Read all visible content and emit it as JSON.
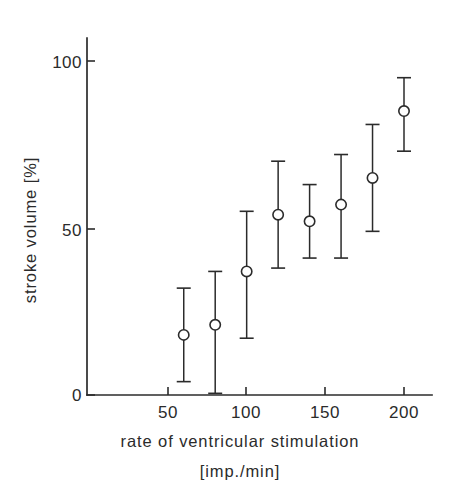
{
  "chart_data": {
    "type": "scatter",
    "title": "",
    "xlabel": "rate of ventricular stimulation",
    "xlabel_units": "[imp./min]",
    "ylabel": "stroke volume [%]",
    "xlim": [
      0,
      215
    ],
    "ylim": [
      0,
      108
    ],
    "grid": false,
    "legend": null,
    "error_bars": "vertical, capped",
    "marker_style": "open circle",
    "x_ticks": [
      50,
      100,
      150,
      200
    ],
    "x_tick_labels": [
      "50",
      "100",
      "150",
      "200"
    ],
    "y_ticks": [
      0,
      50,
      100
    ],
    "y_tick_labels": [
      "0",
      "50",
      "100"
    ],
    "x": [
      60,
      80,
      100,
      120,
      140,
      160,
      180,
      200
    ],
    "values": [
      18,
      21,
      37,
      54,
      52,
      57,
      65,
      85
    ],
    "err_low": [
      4,
      0.5,
      17,
      38,
      41,
      41,
      49,
      73
    ],
    "err_high": [
      32,
      37,
      55,
      70,
      63,
      72,
      81,
      95
    ],
    "points": [
      {
        "x": 60,
        "y": 18,
        "low": 4,
        "high": 32
      },
      {
        "x": 80,
        "y": 21,
        "low": 0.5,
        "high": 37
      },
      {
        "x": 100,
        "y": 37,
        "low": 17,
        "high": 55
      },
      {
        "x": 120,
        "y": 54,
        "low": 38,
        "high": 70
      },
      {
        "x": 140,
        "y": 52,
        "low": 41,
        "high": 63
      },
      {
        "x": 160,
        "y": 57,
        "low": 41,
        "high": 72
      },
      {
        "x": 180,
        "y": 65,
        "low": 49,
        "high": 81
      },
      {
        "x": 200,
        "y": 85,
        "low": 73,
        "high": 95
      }
    ],
    "colors": {
      "ink": "#2b2b2b",
      "marker_fill": "#ffffff",
      "background": "#ffffff"
    }
  },
  "axes": {
    "y_title": "stroke volume [%]",
    "x_title_line1": "rate of ventricular stimulation",
    "x_title_line2": "[imp./min]"
  }
}
